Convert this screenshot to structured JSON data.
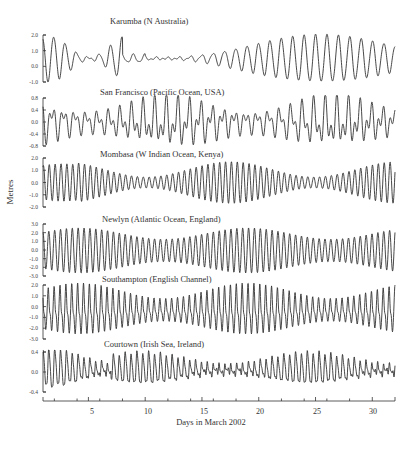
{
  "chart_data": {
    "type": "line",
    "title": "",
    "xlabel": "Days in March 2002",
    "ylabel": "Metres",
    "xlim": [
      1,
      32
    ],
    "x_ticks": [
      5,
      10,
      15,
      20,
      25,
      30
    ],
    "grid": false,
    "legend": "none",
    "panels": [
      {
        "name": "Karumba (N Australia)",
        "y_ticks": [
          "2.0",
          "1.0",
          "0.0",
          "-1.0"
        ],
        "ylim": [
          -1.0,
          2.0
        ],
        "tide_type": "diurnal",
        "description": "Diurnal tide; large amplitude (~1.5 m) early and late in month, near-zero near days 4-5 and 14-16, max around days 24-27"
      },
      {
        "name": "San Francisco (Pacific Ocean,  USA)",
        "y_ticks": [
          "0.8",
          "0.4",
          "0.0",
          "-0.4",
          "-0.8"
        ],
        "ylim": [
          -0.8,
          0.8
        ],
        "tide_type": "mixed",
        "description": "Mixed semidiurnal/diurnal tide with strong diurnal inequality"
      },
      {
        "name": "Mombasa (W Indian Ocean,  Kenya)",
        "y_ticks": [
          "2.0",
          "1.0",
          "0.0",
          "-1.0",
          "-2.0"
        ],
        "ylim": [
          -2.0,
          2.0
        ],
        "tide_type": "semidiurnal",
        "description": "Semidiurnal tide; spring tides near days 1-2 and 15-20, neaps near days 7-9 and 28"
      },
      {
        "name": "Newlyn  (Atlantic Ocean, England)",
        "y_ticks": [
          "3.0",
          "2.0",
          "1.0",
          "0.0",
          "-1.0",
          "-2.0",
          "-3.0"
        ],
        "ylim": [
          -3.0,
          3.0
        ],
        "tide_type": "semidiurnal",
        "description": "Semidiurnal tide; range ~5 m at springs, ~2.5 m at neaps"
      },
      {
        "name": "Southampton (English Channel)",
        "y_ticks": [
          "2.0",
          "1.0",
          "0.0",
          "-1.0",
          "-2.0",
          "-3.0"
        ],
        "ylim": [
          -3.0,
          2.0
        ],
        "tide_type": "semidiurnal-double-high-water",
        "description": "Semidiurnal tide with characteristic double high water"
      },
      {
        "name": "Courtown (Irish Sea, Ireland)",
        "y_ticks": [
          "0.4",
          "0.0",
          "-0.4"
        ],
        "ylim": [
          -0.4,
          0.5
        ],
        "tide_type": "shallow-water",
        "description": "Small amphidromic-point tide with strong shallow-water harmonics; irregular neaps"
      }
    ]
  },
  "axis": {
    "xlabel": "Days in March 2002",
    "ylabel": "Metres",
    "x_tick_labels": [
      "5",
      "10",
      "15",
      "20",
      "25",
      "30"
    ]
  },
  "panels": [
    {
      "title": "Karumba (N Australia)",
      "ticks": [
        "2.0",
        "1.0",
        "0.0",
        "-1.0"
      ]
    },
    {
      "title": "San Francisco (Pacific Ocean,  USA)",
      "ticks": [
        "0.8",
        "0.4",
        "0.0",
        "-0.4",
        "-0.8"
      ]
    },
    {
      "title": "Mombasa (W Indian Ocean,  Kenya)",
      "ticks": [
        "2.0",
        "1.0",
        "0.0",
        "-1.0",
        "-2.0"
      ]
    },
    {
      "title": "Newlyn  (Atlantic Ocean, England)",
      "ticks": [
        "3.0",
        "2.0",
        "1.0",
        "0.0",
        "-1.0",
        "-2.0",
        "-3.0"
      ]
    },
    {
      "title": "Southampton (English Channel)",
      "ticks": [
        "2.0",
        "1.0",
        "0.0",
        "-1.0",
        "-2.0",
        "-3.0"
      ]
    },
    {
      "title": "Courtown (Irish Sea, Ireland)",
      "ticks": [
        "0.4",
        "0.0",
        "-0.4"
      ]
    }
  ]
}
